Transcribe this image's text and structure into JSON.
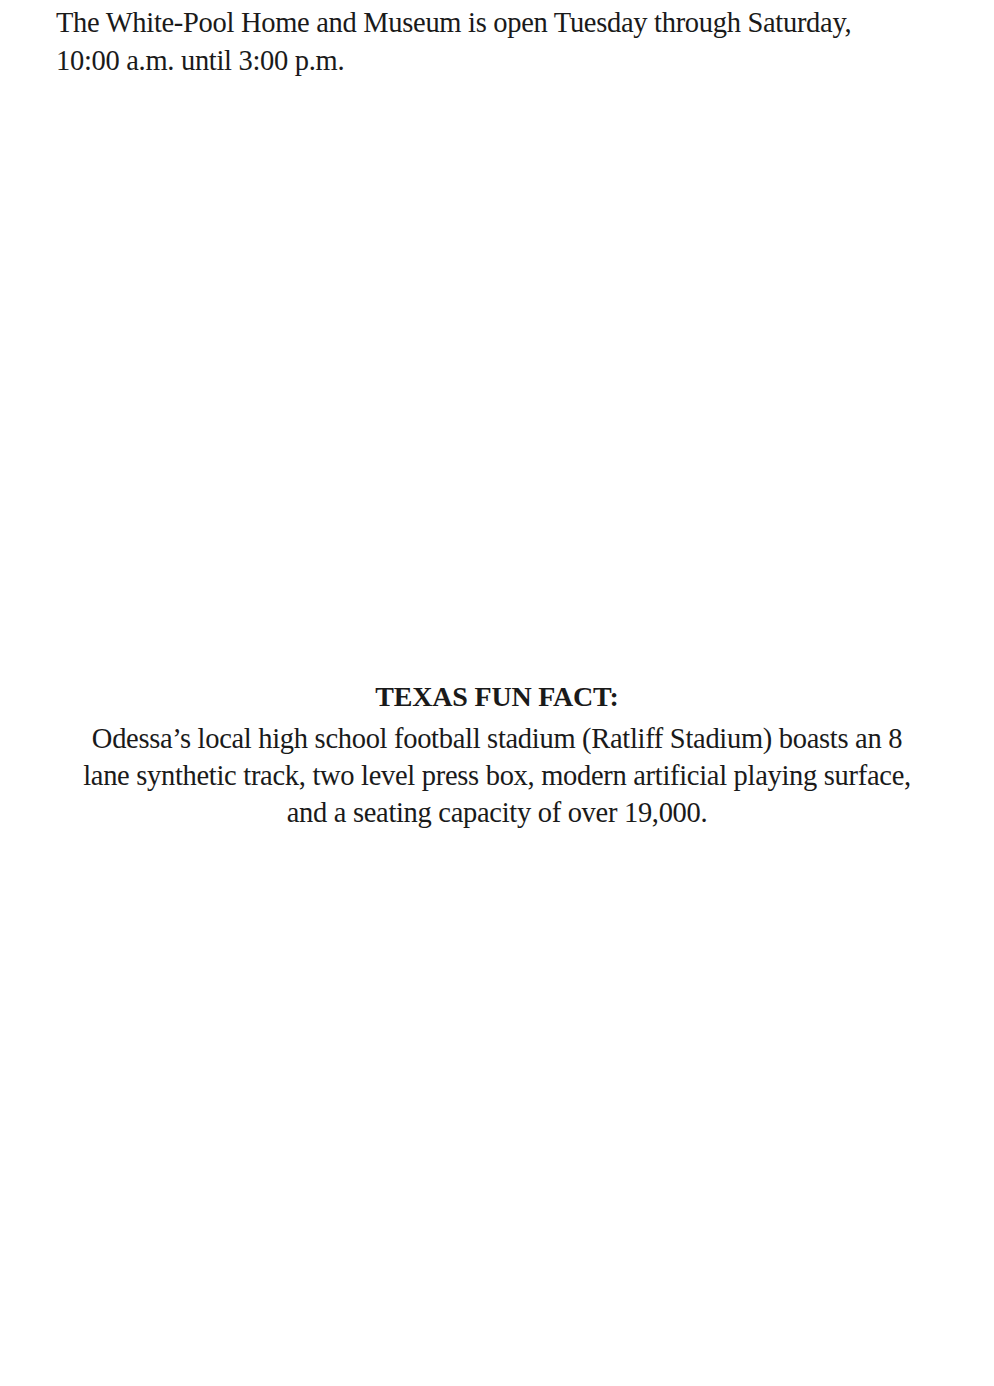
{
  "intro": {
    "lines": [
      "The White-Pool Home and Museum is open Tuesday through Saturday,",
      "10:00 a.m. until 3:00 p.m."
    ]
  },
  "fun_fact": {
    "title": "TEXAS FUN FACT:",
    "lines": [
      "Odessa’s local high school football stadium (Ratliff Stadium) boasts an 8",
      "lane synthetic track, two level press box, modern artificial playing surface,",
      "and a seating capacity of over 19,000."
    ]
  }
}
